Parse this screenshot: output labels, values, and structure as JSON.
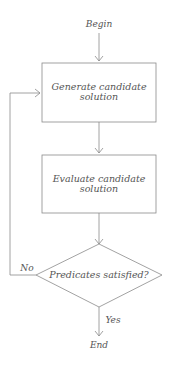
{
  "diagram": {
    "type": "flowchart",
    "start_label": "Begin",
    "end_label": "End",
    "nodes": [
      {
        "id": "generate",
        "shape": "rectangle",
        "line1": "Generate candidate",
        "line2": "solution"
      },
      {
        "id": "evaluate",
        "shape": "rectangle",
        "line1": "Evaluate candidate",
        "line2": "solution"
      },
      {
        "id": "decision",
        "shape": "diamond",
        "text": "Predicates satisfied?"
      }
    ],
    "edges": [
      {
        "from": "Begin",
        "to": "generate"
      },
      {
        "from": "generate",
        "to": "evaluate"
      },
      {
        "from": "evaluate",
        "to": "decision"
      },
      {
        "from": "decision",
        "to": "End",
        "label": "Yes"
      },
      {
        "from": "decision",
        "to": "generate",
        "label": "No"
      }
    ],
    "colors": {
      "line": "#8a8a8a",
      "text": "#555555"
    }
  }
}
